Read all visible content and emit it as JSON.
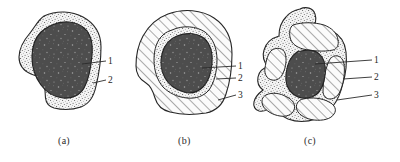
{
  "figure": {
    "title": "",
    "panels": [
      {
        "id": "a",
        "caption": "(a)",
        "callouts": [
          {
            "number": "1",
            "target": "dark-core"
          },
          {
            "number": "2",
            "target": "stippled-layer"
          }
        ]
      },
      {
        "id": "b",
        "caption": "(b)",
        "callouts": [
          {
            "number": "1",
            "target": "dark-core"
          },
          {
            "number": "2",
            "target": "stippled-layer"
          },
          {
            "number": "3",
            "target": "hatched-layer"
          }
        ]
      },
      {
        "id": "c",
        "caption": "(c)",
        "callouts": [
          {
            "number": "1",
            "target": "dark-core"
          },
          {
            "number": "2",
            "target": "stippled-layer"
          },
          {
            "number": "3",
            "target": "hatched-layer"
          }
        ]
      }
    ],
    "layers": {
      "core_label": "1",
      "stipple_label": "2",
      "hatch_label": "3"
    },
    "colors": {
      "background": "#ffffff",
      "outline": "#262626",
      "core_fill": "#4d4d4d",
      "core_speckle": "#b9b9b9",
      "stipple_fill": "#f2f2f2",
      "stipple_dot": "#555555",
      "hatch_fill": "#fafafa",
      "hatch_line": "#3a3a3a",
      "text": "#1d1d1d"
    }
  }
}
